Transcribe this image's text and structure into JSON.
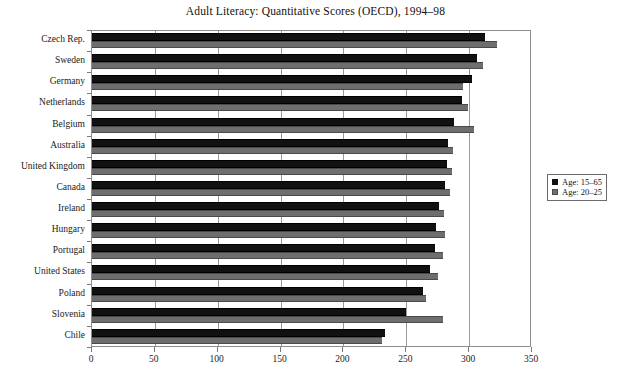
{
  "chart_data": {
    "type": "bar",
    "orientation": "horizontal",
    "title": "Adult Literacy: Quantitative Scores (OECD), 1994–98",
    "xlabel": "",
    "ylabel": "",
    "xlim": [
      0,
      350
    ],
    "xticks": [
      0,
      50,
      100,
      150,
      200,
      250,
      300,
      350
    ],
    "grid": "vertical",
    "legend_position": "right",
    "categories": [
      "Czech Rep.",
      "Sweden",
      "Germany",
      "Netherlands",
      "Belgium",
      "Australia",
      "United Kingdom",
      "Canada",
      "Ireland",
      "Hungary",
      "Portugal",
      "United States",
      "Poland",
      "Slovenia",
      "Chile"
    ],
    "series": [
      {
        "name": "Age: 15–65",
        "color": "#111111",
        "values": [
          313,
          306,
          302,
          294,
          288,
          283,
          282,
          281,
          276,
          274,
          273,
          269,
          263,
          250,
          233
        ]
      },
      {
        "name": "Age: 20–25",
        "color": "#6e6e6e",
        "values": [
          322,
          311,
          295,
          299,
          304,
          287,
          286,
          285,
          280,
          281,
          279,
          275,
          266,
          279,
          231
        ]
      }
    ]
  },
  "legend": {
    "entries": [
      {
        "label": "Age: 15–65",
        "swatch": "primary"
      },
      {
        "label": "Age: 20–25",
        "swatch": "secondary"
      }
    ]
  },
  "colors": {
    "series_primary": "#111111",
    "series_secondary": "#6e6e6e",
    "axis": "#8d8d8d",
    "grid": "#9a9a9a",
    "background": "#ffffff",
    "text": "#1a1a1a"
  }
}
